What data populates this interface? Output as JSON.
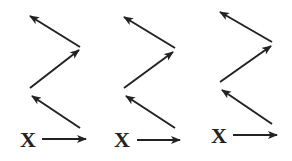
{
  "diagram": {
    "stroke_color": "#222222",
    "background": "#ffffff",
    "panels": [
      {
        "label": "X",
        "label_pos": [
          20,
          147
        ],
        "arrows": [
          {
            "from": [
              42,
              139
            ],
            "to": [
              86,
              139
            ]
          },
          {
            "from": [
              80,
              128
            ],
            "to": [
              32,
              96
            ]
          },
          {
            "from": [
              30,
              88
            ],
            "to": [
              79,
              50
            ]
          },
          {
            "from": [
              80,
              47
            ],
            "to": [
              30,
              16
            ]
          }
        ]
      },
      {
        "label": "X",
        "label_pos": [
          114,
          147
        ],
        "arrows": [
          {
            "from": [
              137,
              140
            ],
            "to": [
              180,
              140
            ]
          },
          {
            "from": [
              175,
              128
            ],
            "to": [
              126,
              96
            ]
          },
          {
            "from": [
              124,
              88
            ],
            "to": [
              173,
              52
            ]
          },
          {
            "from": [
              175,
              48
            ],
            "to": [
              124,
              17
            ]
          }
        ]
      },
      {
        "label": "X",
        "label_pos": [
          211,
          143
        ],
        "arrows": [
          {
            "from": [
              233,
              135
            ],
            "to": [
              277,
              135
            ]
          },
          {
            "from": [
              272,
              124
            ],
            "to": [
              222,
              90
            ]
          },
          {
            "from": [
              220,
              82
            ],
            "to": [
              271,
              46
            ]
          },
          {
            "from": [
              272,
              42
            ],
            "to": [
              220,
              12
            ]
          }
        ]
      }
    ]
  }
}
